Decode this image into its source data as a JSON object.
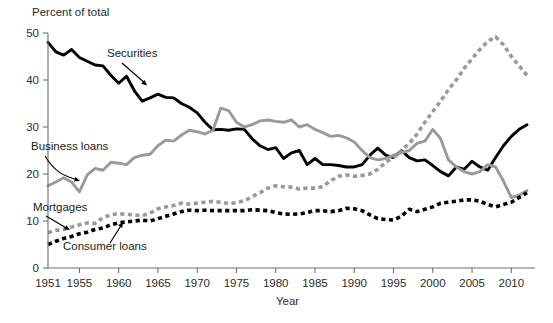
{
  "chart_data": {
    "type": "line",
    "title": "",
    "ylabel": "Percent of total",
    "xlabel": "Year",
    "ylim": [
      0,
      50
    ],
    "xlim": [
      1951,
      2012
    ],
    "yticks": [
      0,
      10,
      20,
      30,
      40,
      50
    ],
    "xticks": [
      1951,
      1955,
      1960,
      1965,
      1970,
      1975,
      1980,
      1985,
      1990,
      1995,
      2000,
      2005,
      2010
    ],
    "grid": false,
    "legend_position": "inline-annotations",
    "annotations": [
      {
        "label": "Securities",
        "series": "Securities",
        "x": 1963,
        "y": 40.5
      },
      {
        "label": "Business loans",
        "series": "Business loans",
        "x": 1952,
        "y": 26.5
      },
      {
        "label": "Mortgages",
        "series": "Mortgages",
        "x": 1952,
        "y": 13.5
      },
      {
        "label": "Consumer loans",
        "series": "Consumer loans",
        "x": 1958.5,
        "y": 6.5
      }
    ],
    "x": [
      1951,
      1952,
      1953,
      1954,
      1955,
      1956,
      1957,
      1958,
      1959,
      1960,
      1961,
      1962,
      1963,
      1964,
      1965,
      1966,
      1967,
      1968,
      1969,
      1970,
      1971,
      1972,
      1973,
      1974,
      1975,
      1976,
      1977,
      1978,
      1979,
      1980,
      1981,
      1982,
      1983,
      1984,
      1985,
      1986,
      1987,
      1988,
      1989,
      1990,
      1991,
      1992,
      1993,
      1994,
      1995,
      1996,
      1997,
      1998,
      1999,
      2000,
      2001,
      2002,
      2003,
      2004,
      2005,
      2006,
      2007,
      2008,
      2009,
      2010,
      2011,
      2012
    ],
    "series": [
      {
        "name": "Securities",
        "color": "#000000",
        "style": "solid",
        "values": [
          48.0,
          46.0,
          45.3,
          46.5,
          44.8,
          44.0,
          43.2,
          43.0,
          41.0,
          39.3,
          40.8,
          37.7,
          35.5,
          36.2,
          37.0,
          36.3,
          36.2,
          35.0,
          34.2,
          33.0,
          31.0,
          29.4,
          29.5,
          29.3,
          29.6,
          29.5,
          27.5,
          26.0,
          25.2,
          25.6,
          23.3,
          24.5,
          25.0,
          22.0,
          23.3,
          22.0,
          22.0,
          21.8,
          21.5,
          21.5,
          22.0,
          24.0,
          25.5,
          24.0,
          23.5,
          25.0,
          23.5,
          22.8,
          23.0,
          21.8,
          20.5,
          19.6,
          21.5,
          21.0,
          22.7,
          21.5,
          20.8,
          23.5,
          26.0,
          28.0,
          29.5,
          30.5
        ]
      },
      {
        "name": "Business loans",
        "color": "#9a9a9a",
        "style": "solid",
        "values": [
          17.5,
          18.3,
          19.2,
          18.3,
          16.2,
          19.8,
          21.2,
          20.8,
          22.5,
          22.3,
          22.0,
          23.5,
          24.0,
          24.2,
          26.0,
          27.2,
          27.0,
          28.3,
          29.3,
          29.0,
          28.5,
          29.3,
          34.0,
          33.5,
          31.0,
          30.0,
          30.5,
          31.3,
          31.5,
          31.2,
          31.0,
          31.5,
          30.0,
          30.5,
          29.5,
          28.8,
          28.0,
          28.2,
          27.7,
          26.8,
          25.0,
          23.5,
          23.0,
          23.3,
          24.0,
          24.5,
          25.0,
          26.5,
          27.0,
          29.5,
          27.5,
          23.0,
          21.5,
          20.5,
          20.0,
          20.5,
          22.0,
          21.5,
          18.5,
          15.0,
          15.5,
          16.5
        ]
      },
      {
        "name": "Mortgages",
        "color": "#9a9a9a",
        "style": "dotted",
        "values": [
          7.5,
          8.0,
          8.2,
          8.7,
          9.2,
          9.6,
          9.5,
          10.7,
          11.3,
          11.6,
          11.4,
          11.3,
          11.1,
          11.7,
          12.6,
          13.0,
          13.3,
          13.8,
          13.6,
          13.8,
          14.0,
          14.2,
          14.0,
          13.7,
          13.9,
          14.3,
          15.2,
          16.0,
          17.0,
          17.5,
          17.3,
          17.2,
          16.8,
          17.0,
          17.0,
          17.3,
          18.6,
          19.5,
          19.8,
          19.5,
          19.7,
          20.0,
          21.0,
          22.5,
          23.5,
          25.0,
          26.5,
          28.5,
          31.0,
          33.3,
          35.5,
          38.0,
          40.0,
          42.5,
          44.5,
          46.5,
          48.2,
          49.2,
          47.5,
          45.0,
          43.0,
          41.0
        ]
      },
      {
        "name": "Consumer loans",
        "color": "#000000",
        "style": "dotted",
        "values": [
          5.0,
          5.7,
          6.3,
          6.7,
          7.3,
          7.6,
          8.2,
          8.5,
          9.2,
          9.6,
          9.8,
          10.0,
          10.2,
          10.0,
          10.5,
          11.0,
          11.5,
          12.0,
          12.3,
          12.2,
          12.3,
          12.2,
          12.2,
          12.2,
          12.2,
          12.2,
          12.4,
          12.3,
          12.2,
          11.8,
          11.5,
          11.4,
          11.5,
          11.8,
          12.2,
          12.2,
          12.0,
          12.2,
          12.7,
          12.6,
          12.2,
          11.3,
          10.5,
          10.3,
          10.2,
          11.0,
          12.5,
          12.0,
          12.5,
          13.0,
          13.8,
          14.0,
          14.2,
          14.5,
          14.5,
          14.2,
          13.5,
          13.0,
          13.5,
          14.0,
          15.0,
          16.0
        ]
      }
    ]
  },
  "labels": {
    "ylabel": "Percent of total",
    "xlabel": "Year",
    "ytick_0": "0",
    "ytick_10": "10",
    "ytick_20": "20",
    "ytick_30": "30",
    "ytick_40": "40",
    "ytick_50": "50",
    "xtick_1951": "1951",
    "xtick_1955": "1955",
    "xtick_1960": "1960",
    "xtick_1965": "1965",
    "xtick_1970": "1970",
    "xtick_1975": "1975",
    "xtick_1980": "1980",
    "xtick_1985": "1985",
    "xtick_1990": "1990",
    "xtick_1995": "1995",
    "xtick_2000": "2000",
    "xtick_2005": "2005",
    "xtick_2010": "2010",
    "annot_securities": "Securities",
    "annot_business": "Business loans",
    "annot_mortgages": "Mortgages",
    "annot_consumer": "Consumer loans"
  },
  "colors": {
    "securities": "#000000",
    "business_loans": "#9a9a9a",
    "mortgages": "#9a9a9a",
    "consumer_loans": "#000000",
    "axis": "#6e6e6e",
    "background": "#ffffff"
  }
}
